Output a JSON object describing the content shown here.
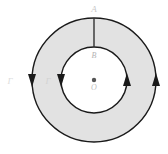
{
  "figure": {
    "type": "annulus-circulation-diagram",
    "background_color": "#ffffff",
    "width": 168,
    "height": 154
  },
  "geometry": {
    "center": {
      "x": 94,
      "y": 80
    },
    "outer_radius": 62,
    "inner_radius": 33,
    "outer_circle": {
      "stroke_color": "#1a1a1a",
      "stroke_width": 1.4,
      "fill_color": "#e2e2e2"
    },
    "inner_circle": {
      "stroke_color": "#1a1a1a",
      "stroke_width": 1.4,
      "fill_color": "#ffffff"
    },
    "annulus_fill_color": "#e2e2e2",
    "center_dot": {
      "radius": 2.2,
      "color": "#555555"
    },
    "radial_segment": {
      "x": 94,
      "y_start": 18,
      "y_end": 47,
      "stroke_color": "#333333",
      "stroke_width": 1.4
    }
  },
  "labels": {
    "point_a": {
      "text": "A",
      "x": 94,
      "y": 12,
      "color": "#c8c8c8",
      "size": 9
    },
    "point_b": {
      "text": "B",
      "x": 94,
      "y": 58,
      "color": "#b4b4b4",
      "size": 8
    },
    "point_o": {
      "text": "O",
      "x": 94,
      "y": 90,
      "color": "#c0c0c0",
      "size": 8
    },
    "gamma_outer": {
      "text": "Γ",
      "x": 10,
      "y": 84,
      "color": "#dcdcdc",
      "size": 9
    },
    "gamma_inner": {
      "text": "Γ",
      "x": 48,
      "y": 84,
      "color": "#d2d2d2",
      "size": 9
    }
  },
  "arrowheads": [
    {
      "name": "outer-left-arrow",
      "x": 32,
      "y": 80,
      "direction": "down",
      "color": "#1a1a1a"
    },
    {
      "name": "inner-left-arrow",
      "x": 61,
      "y": 80,
      "direction": "down",
      "color": "#1a1a1a"
    },
    {
      "name": "inner-right-arrow",
      "x": 127,
      "y": 80,
      "direction": "up",
      "color": "#1a1a1a"
    },
    {
      "name": "outer-right-arrow",
      "x": 156,
      "y": 80,
      "direction": "up",
      "color": "#1a1a1a"
    }
  ],
  "chart_data": {
    "type": "diagram",
    "title": "",
    "elements": [
      {
        "label": "A",
        "role": "outer-boundary-point",
        "radius": 62,
        "angle_deg": 90
      },
      {
        "label": "B",
        "role": "inner-boundary-point",
        "radius": 33,
        "angle_deg": 90
      },
      {
        "label": "O",
        "role": "center",
        "radius": 0,
        "angle_deg": 0
      },
      {
        "label": "Γ",
        "role": "outer-contour"
      },
      {
        "label": "Γ",
        "role": "inner-contour"
      }
    ],
    "orientation": "counterclockwise"
  }
}
